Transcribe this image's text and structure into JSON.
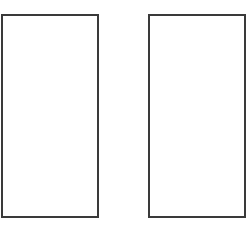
{
  "canvas": {
    "width": 247,
    "height": 228,
    "background": "#ffffff"
  },
  "panels": [
    {
      "id": "left",
      "label": "",
      "border_color": "#3a3a3a",
      "fill": "#ffffff"
    },
    {
      "id": "right",
      "label": "",
      "border_color": "#3a3a3a",
      "fill": "#ffffff"
    }
  ]
}
